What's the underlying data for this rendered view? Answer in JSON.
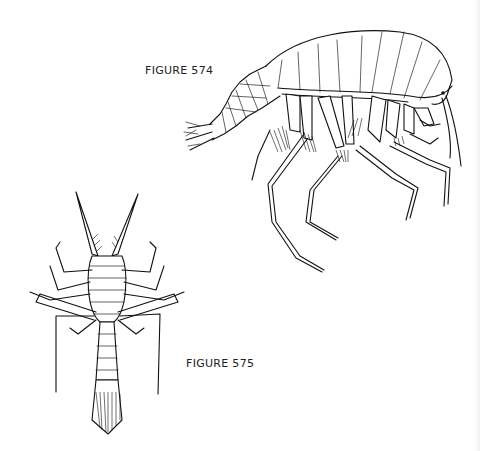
{
  "page": {
    "figures": [
      {
        "id": "574",
        "label": "FIGURE 574",
        "subject": "amphipod-lateral-view"
      },
      {
        "id": "575",
        "label": "FIGURE 575",
        "subject": "crustacean-dorsal-view"
      }
    ]
  }
}
